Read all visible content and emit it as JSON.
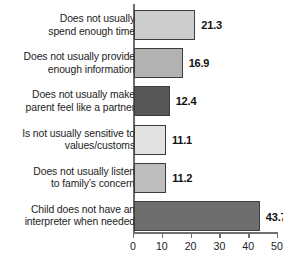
{
  "chart_data": {
    "type": "bar",
    "orientation": "horizontal",
    "title": "",
    "xlabel": "",
    "ylabel": "",
    "xlim": [
      0,
      50
    ],
    "xticks": [
      0,
      10,
      20,
      30,
      40,
      50
    ],
    "xtick_labels": [
      "0",
      "10",
      "20",
      "30",
      "40",
      "50"
    ],
    "grid": false,
    "legend": "none",
    "categories": [
      "Does not usually\nspend enough time",
      "Does not usually provide\nenough information",
      "Does not usually make\nparent feel like a partner",
      "Is not usually sensitive to\nvalues/customs",
      "Does not usually listen\nto family’s concern",
      "Child does not have an\ninterpreter when needed"
    ],
    "values": [
      21.3,
      16.9,
      12.4,
      11.1,
      11.2,
      43.7
    ],
    "value_labels": [
      "21.3",
      "16.9",
      "12.4",
      "11.1",
      "11.2",
      "43.7"
    ],
    "annotations": [
      {
        "category_index": 5,
        "symbol": "†",
        "attached_to": "43.7"
      }
    ],
    "bar_colors": [
      "#cdcdcd",
      "#b2b2b2",
      "#575757",
      "#e2e2e2",
      "#bdbdbd",
      "#6e6e6e"
    ],
    "bar_edge_color": "#3d3d3d",
    "axis_color": "#6f6f6f",
    "background": "#ffffff",
    "text_color": "#1d1d1d"
  }
}
